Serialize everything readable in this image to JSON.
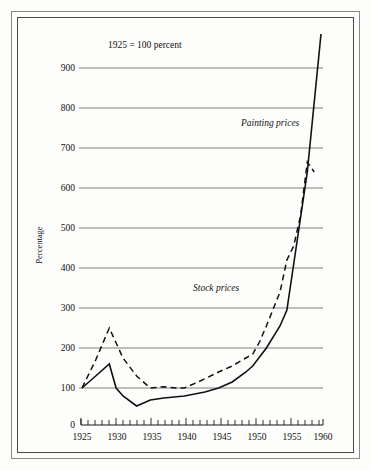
{
  "figure": {
    "note": "1925 = 100 percent",
    "y_axis_title": "Percentage",
    "label_painting": "Painting prices",
    "label_stock": "Stock prices",
    "zero_label": "0"
  },
  "chart_data": {
    "type": "line",
    "title": "1925 = 100 percent",
    "xlabel": "",
    "ylabel": "Percentage",
    "xlim": [
      1925,
      1960
    ],
    "ylim": [
      0,
      1000
    ],
    "yticks": [
      100,
      200,
      300,
      400,
      500,
      600,
      700,
      800,
      900
    ],
    "ytick_labels": [
      "100",
      "200",
      "300",
      "400",
      "500",
      "600",
      "700",
      "800",
      "900"
    ],
    "xticks": [
      1925,
      1930,
      1935,
      1940,
      1945,
      1950,
      1955,
      1960
    ],
    "xtick_labels": [
      "1925",
      "1930",
      "1935",
      "1940",
      "1945",
      "1950",
      "1955",
      "1960"
    ],
    "minor_xticks_interval": 1,
    "grid": "horizontal",
    "legend": "inline-annotations",
    "series": [
      {
        "name": "Painting prices",
        "style": "solid",
        "x": [
          1925,
          1927,
          1929,
          1930,
          1931,
          1933,
          1935,
          1937,
          1940,
          1943,
          1945,
          1947,
          1949,
          1950,
          1952,
          1954,
          1955,
          1956,
          1958,
          1960
        ],
        "values": [
          100,
          130,
          160,
          100,
          80,
          55,
          70,
          75,
          80,
          90,
          100,
          115,
          140,
          155,
          200,
          255,
          295,
          410,
          640,
          985
        ]
      },
      {
        "name": "Stock prices",
        "style": "dashed",
        "x": [
          1925,
          1927,
          1929,
          1931,
          1933,
          1935,
          1937,
          1939,
          1940,
          1942,
          1945,
          1947,
          1949,
          1950,
          1951,
          1952,
          1954,
          1955,
          1956,
          1957,
          1958,
          1959
        ],
        "values": [
          100,
          170,
          250,
          175,
          130,
          100,
          103,
          100,
          100,
          115,
          140,
          155,
          175,
          185,
          215,
          255,
          340,
          420,
          455,
          530,
          665,
          640
        ]
      }
    ]
  }
}
